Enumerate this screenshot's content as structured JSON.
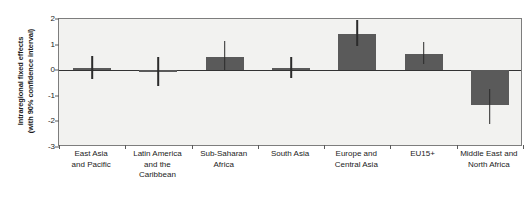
{
  "chart_data": {
    "type": "bar",
    "title": "",
    "xlabel": "",
    "ylabel": "Intraregional fixed effects (with 90% confidence interval)",
    "ylabel_line1": "Intraregional fixed effects",
    "ylabel_line2": "(with 90% confidence interval)",
    "categories": [
      "East Asia and Pacific",
      "Latin America and the Caribbean",
      "Sub-Saharan Africa",
      "South Asia",
      "Europe and Central Asia",
      "EU15+",
      "Middle East and North Africa"
    ],
    "category_lines": [
      [
        "East Asia",
        "and Pacific"
      ],
      [
        "Latin America",
        "and the",
        "Caribbean"
      ],
      [
        "Sub-Saharan",
        "Africa"
      ],
      [
        "South Asia"
      ],
      [
        "Europe and",
        "Central Asia"
      ],
      [
        "EU15+"
      ],
      [
        "Middle East and",
        "North Africa"
      ]
    ],
    "values": [
      0.08,
      -0.03,
      0.5,
      0.1,
      1.4,
      0.65,
      -1.35
    ],
    "ci_low": [
      -0.35,
      -0.6,
      0.02,
      -0.3,
      0.95,
      0.25,
      -2.1
    ],
    "ci_high": [
      0.55,
      0.5,
      1.15,
      0.5,
      1.95,
      1.1,
      -0.75
    ],
    "ylim": [
      -3,
      2
    ],
    "yticks": [
      2,
      1,
      0,
      -1,
      -2,
      -3
    ],
    "ytick_labels": [
      "2",
      "1",
      "0",
      "-1",
      "-2",
      "-3"
    ],
    "grid": false,
    "legend": "none",
    "bar_color": "#5a5a5a",
    "whisker_color": "#2b2b2b",
    "panel_background": "#f2f2f0",
    "axis_color": "#7d7d7d",
    "zero_line_color": "#333333"
  }
}
